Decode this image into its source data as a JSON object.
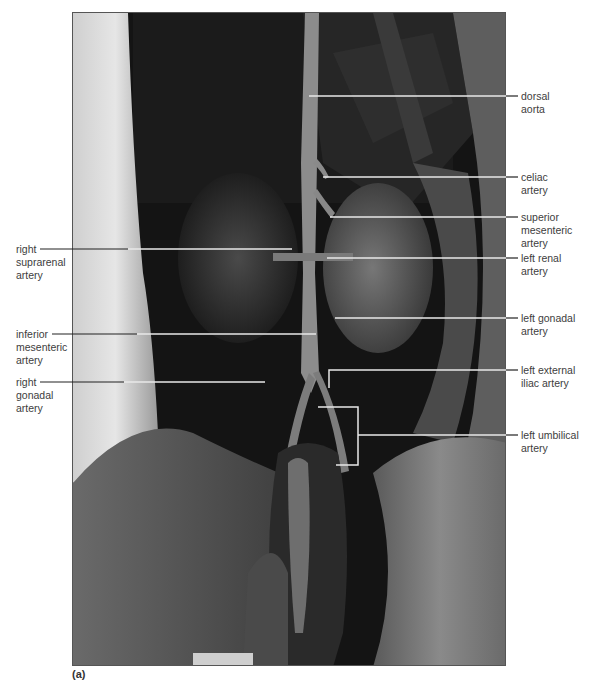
{
  "figure": {
    "panel_label": "(a)",
    "image_description": "Grayscale dissection photograph of abdominal cavity showing arteries branching from dorsal aorta",
    "labels_right": [
      {
        "id": "dorsal-aorta",
        "text": "dorsal\naorta",
        "y": 90,
        "line_y": 96,
        "target_x": 309
      },
      {
        "id": "celiac-artery",
        "text": "celiac\nartery",
        "y": 171,
        "line_y": 177,
        "target_x": 323
      },
      {
        "id": "superior-mesenteric-artery",
        "text": "superior\nmesenteric\nartery",
        "y": 211,
        "line_y": 217,
        "target_x": 330
      },
      {
        "id": "left-renal-artery",
        "text": "left renal\nartery",
        "y": 252,
        "line_y": 258,
        "target_x": 327
      },
      {
        "id": "left-gonadal-artery",
        "text": "left gonadal\nartery",
        "y": 312,
        "line_y": 318,
        "target_x": 335
      },
      {
        "id": "left-external-iliac-artery",
        "text": "left external\niliac artery",
        "y": 364,
        "line_y": 370,
        "target_x": 330
      },
      {
        "id": "left-umbilical-artery",
        "text": "left umbilical\nartery",
        "y": 429,
        "line_y": 435,
        "target_x": 358
      }
    ],
    "labels_left": [
      {
        "id": "right-suprarenal-artery",
        "text": "right\nsuprarenal\nartery",
        "y": 243,
        "line_y": 249,
        "target_x": 292
      },
      {
        "id": "inferior-mesenteric-artery",
        "text": "inferior\nmesenteric\nartery",
        "y": 328,
        "line_y": 334,
        "target_x": 316
      },
      {
        "id": "right-gonadal-artery",
        "text": "right\ngonadal\nartery",
        "y": 376,
        "line_y": 382,
        "target_x": 265
      }
    ],
    "colors": {
      "leader_on_dark": "#e8e8e8",
      "leader_on_light": "#222222",
      "label_text": "#3d3d3d",
      "frame": "#555555"
    }
  }
}
